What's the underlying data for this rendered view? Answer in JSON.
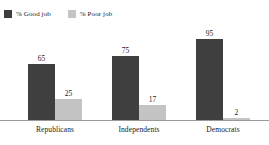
{
  "chart_data": {
    "type": "bar",
    "title": "",
    "subtitle": "",
    "xlabel": "",
    "ylabel": "",
    "ylim": [
      0,
      100
    ],
    "grid": false,
    "legend_position": "top-left",
    "categories": [
      "Republicans",
      "Independents",
      "Democrats"
    ],
    "series": [
      {
        "name": "% Good job",
        "color": "#3f3f3f",
        "values": [
          65,
          75,
          95
        ],
        "value_labels": [
          "65",
          "75",
          "95"
        ]
      },
      {
        "name": "% Poor job",
        "color": "#c4c4c4",
        "values": [
          25,
          17,
          2
        ],
        "value_labels": [
          "25",
          "17",
          "2"
        ]
      }
    ]
  },
  "legend": {
    "items": [
      {
        "label": "% Good job",
        "color": "#3f3f3f",
        "swatch_name": "legend-swatch-good-job"
      },
      {
        "label": "% Poor job",
        "color": "#c4c4c4",
        "swatch_name": "legend-swatch-poor-job"
      }
    ]
  },
  "axis": {
    "baseline_color": "#9a9a9a"
  }
}
